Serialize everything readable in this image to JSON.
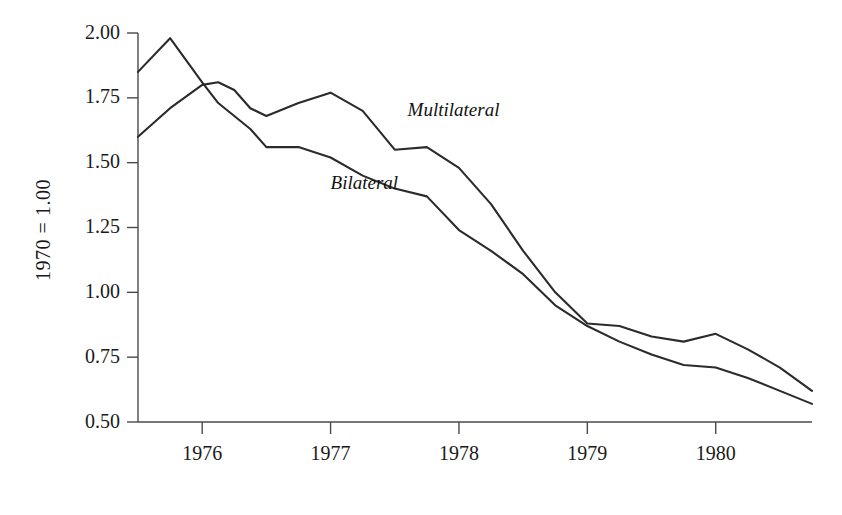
{
  "chart_data": {
    "type": "line",
    "title": "",
    "subtitle": "",
    "xlabel": "",
    "ylabel": "1970 = 1.00",
    "xlim": [
      1975.5,
      1980.75
    ],
    "ylim": [
      0.5,
      2.0
    ],
    "grid": false,
    "legend_position": "inline-annotation",
    "x_tick_labels": [
      "1976",
      "1977",
      "1978",
      "1979",
      "1980"
    ],
    "x_ticks": [
      1976,
      1977,
      1978,
      1979,
      1980
    ],
    "y_tick_labels": [
      "2.00",
      "1.75",
      "1.50",
      "1.25",
      "1.00",
      "0.75",
      "0.50"
    ],
    "y_ticks": [
      2.0,
      1.75,
      1.5,
      1.25,
      1.0,
      0.75,
      0.5
    ],
    "x": [
      1975.5,
      1975.75,
      1976.0,
      1976.125,
      1976.25,
      1976.375,
      1976.5,
      1976.75,
      1977.0,
      1977.25,
      1977.5,
      1977.75,
      1978.0,
      1978.25,
      1978.5,
      1978.75,
      1979.0,
      1979.25,
      1979.5,
      1979.75,
      1980.0,
      1980.25,
      1980.5,
      1980.75
    ],
    "series": [
      {
        "name": "Bilateral",
        "color": "#2b2b2b",
        "label_x": 1977.0,
        "label_y": 1.4,
        "values": [
          1.85,
          1.98,
          1.81,
          1.73,
          1.68,
          1.63,
          1.56,
          1.56,
          1.52,
          1.45,
          1.4,
          1.37,
          1.24,
          1.16,
          1.07,
          0.95,
          0.87,
          0.81,
          0.76,
          0.72,
          0.71,
          0.67,
          0.62,
          0.57
        ]
      },
      {
        "name": "Multilateral",
        "color": "#2b2b2b",
        "label_x": 1977.6,
        "label_y": 1.68,
        "values": [
          1.6,
          1.71,
          1.8,
          1.81,
          1.78,
          1.71,
          1.68,
          1.73,
          1.77,
          1.7,
          1.55,
          1.56,
          1.48,
          1.34,
          1.16,
          1.0,
          0.88,
          0.87,
          0.83,
          0.81,
          0.84,
          0.78,
          0.71,
          0.62
        ]
      }
    ],
    "annotations": [
      {
        "text": "Multilateral",
        "style": "italic"
      },
      {
        "text": "Bilateral",
        "style": "italic"
      }
    ],
    "colors": {
      "line": "#2b2b2b",
      "axis": "#4a4a4a",
      "text": "#1a1a1a",
      "background": "#ffffff"
    }
  }
}
